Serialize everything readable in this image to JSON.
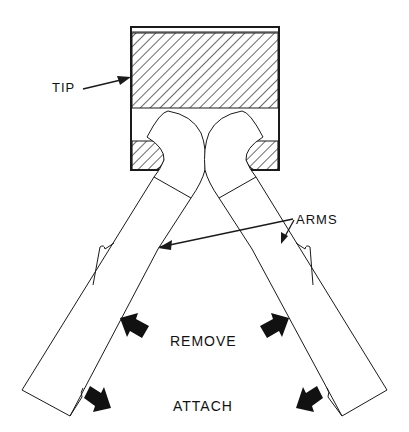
{
  "diagram": {
    "labels": {
      "tip": "TIP",
      "arms": "ARMS",
      "remove": "REMOVE",
      "attach": "ATTACH"
    },
    "colors": {
      "line": "#1a1a1a",
      "background": "#ffffff"
    }
  }
}
